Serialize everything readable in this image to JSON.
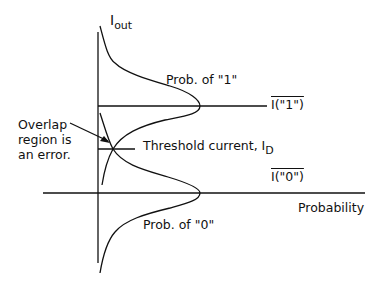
{
  "diagram": {
    "y_axis_label": "I",
    "y_axis_label_sub": "out",
    "x_axis_label": "Probability",
    "curve_one_label": "Prob. of \"1\"",
    "curve_zero_label": "Prob. of \"0\"",
    "level_one_label": "I(\"1\")",
    "level_zero_label": "I(\"0\")",
    "threshold_label": "Threshold current, I",
    "threshold_label_sub": "D",
    "overlap_note_lines": [
      "Overlap",
      "region is",
      "an error."
    ],
    "line_color": "#111111"
  }
}
